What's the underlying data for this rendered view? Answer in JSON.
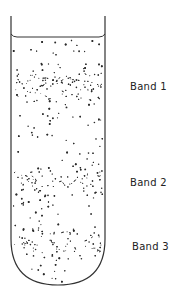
{
  "figure": {
    "colors": {
      "background": "#ffffff",
      "outline": "#333333",
      "particles": "#2a2a2a",
      "label": "#222222"
    },
    "tube": {
      "left_x": 11,
      "right_x": 105,
      "top_y": 16,
      "meniscus_y": 37,
      "bottom_y": 285
    },
    "bands": [
      {
        "label": "Band 1",
        "center_y": 86,
        "label_x": 130,
        "label_y": 81
      },
      {
        "label": "Band 2",
        "center_y": 183,
        "label_x": 130,
        "label_y": 177
      },
      {
        "label": "Band 3",
        "center_y": 243,
        "label_x": 132,
        "label_y": 241
      }
    ]
  }
}
